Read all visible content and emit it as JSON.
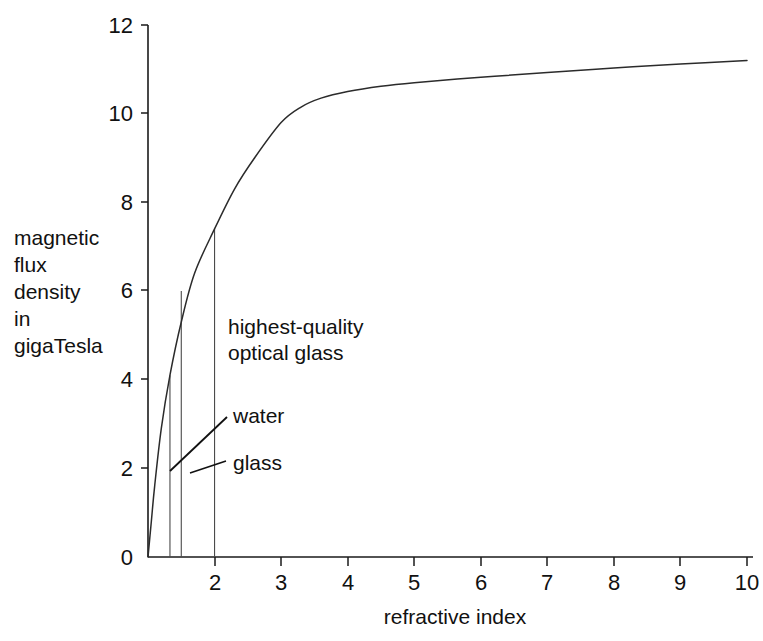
{
  "chart_data": {
    "type": "line",
    "title": "",
    "xlabel": "refractive index",
    "ylabel": "magnetic flux density in gigaTesla",
    "ylabel_lines": [
      "magnetic",
      "flux",
      "density",
      "in",
      "gigaTesla"
    ],
    "xlim": [
      1,
      10
    ],
    "ylim": [
      0,
      12
    ],
    "xticks": [
      1,
      2,
      3,
      4,
      5,
      6,
      7,
      8,
      9,
      10
    ],
    "xticklabels": [
      "",
      "2",
      "3",
      "4",
      "5",
      "6",
      "7",
      "8",
      "9",
      "10"
    ],
    "yticks": [
      0,
      2,
      4,
      6,
      8,
      10,
      12
    ],
    "yticklabels": [
      "0",
      "2",
      "4",
      "6",
      "8",
      "10",
      "12"
    ],
    "grid": false,
    "legend": false,
    "line_color": "#2b2b2b",
    "x": [
      1.0,
      1.05,
      1.1,
      1.2,
      1.33,
      1.5,
      1.7,
      2.0,
      2.3,
      2.6,
      3.0,
      3.3,
      3.6,
      4.0,
      4.5,
      5.0,
      6.0,
      7.0,
      8.0,
      9.0,
      10.0
    ],
    "y": [
      0.0,
      0.8,
      1.6,
      2.9,
      4.1,
      5.3,
      6.4,
      7.4,
      8.3,
      9.0,
      9.8,
      10.15,
      10.35,
      10.5,
      10.62,
      10.7,
      10.82,
      10.93,
      11.03,
      11.12,
      11.2
    ],
    "markers": [
      {
        "name": "water",
        "x": 1.33,
        "y": 4.1
      },
      {
        "name": "glass",
        "x": 1.5,
        "y": 6.0
      },
      {
        "name": "highest-quality optical glass",
        "x": 2.0,
        "y": 7.4
      }
    ],
    "annotations": [
      {
        "id": "optical-glass",
        "lines": [
          "highest-quality",
          "optical glass"
        ],
        "target_x": 2.0,
        "target_y": 7.4
      },
      {
        "id": "water",
        "lines": [
          "water"
        ],
        "target_x": 1.33,
        "target_y": 4.1
      },
      {
        "id": "glass",
        "lines": [
          "glass"
        ],
        "target_x": 1.5,
        "target_y": 6.0
      }
    ]
  },
  "axes": {
    "x_title": "refractive index",
    "y_title_lines": [
      "magnetic",
      "flux",
      "density",
      "in",
      "gigaTesla"
    ],
    "x_tick_labels": [
      "2",
      "3",
      "4",
      "5",
      "6",
      "7",
      "8",
      "9",
      "10"
    ],
    "y_tick_labels": [
      "12",
      "10",
      "8",
      "6",
      "4",
      "2",
      "0"
    ]
  },
  "annotations": {
    "optical_glass_line1": "highest-quality",
    "optical_glass_line2": "optical glass",
    "water": "water",
    "glass": "glass"
  },
  "colors": {
    "background": "#ffffff",
    "ink": "#111111",
    "curve": "#2b2b2b",
    "dropline": "#4a4a4a"
  }
}
